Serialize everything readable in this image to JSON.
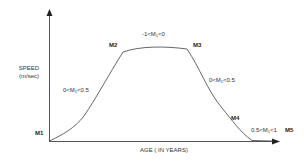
{
  "diagram": {
    "type": "speed-vs-age curve",
    "y_axis": {
      "label_line1": "SPEED",
      "label_line2": "(m/sec)"
    },
    "x_axis": {
      "label": "AGE ( IN YEARS)"
    },
    "points": [
      {
        "id": "M1",
        "label": "M1"
      },
      {
        "id": "M2",
        "label": "M2"
      },
      {
        "id": "M3",
        "label": "M3"
      },
      {
        "id": "M4",
        "label": "M4"
      },
      {
        "id": "M5",
        "label": "M5"
      }
    ],
    "segments": [
      {
        "range": "M1-M2",
        "pre": "0<M",
        "sub": "1",
        "post": "<0.5"
      },
      {
        "range": "M2-M3",
        "pre": "-1<M",
        "sub": "1",
        "post": "<0"
      },
      {
        "range": "M3-M4",
        "pre": "0<M",
        "sub": "1",
        "post": "<0.5"
      },
      {
        "range": "M4-M5",
        "pre": "0.5<M",
        "sub": "1",
        "post": "<1"
      }
    ],
    "colors": {
      "line": "#555555",
      "axis": "#444444",
      "text": "#333333"
    }
  }
}
